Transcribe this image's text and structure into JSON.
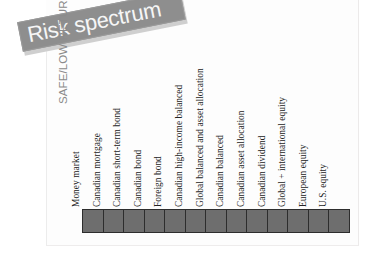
{
  "figure": {
    "title": "Risk spectrum",
    "axis_caption": "SAFE/LOW RETURN",
    "banner_color": "#8e8e8e",
    "banner_text_color": "#f6f6f6",
    "cell_color": "#6e6e6e",
    "cell_border_color": "#2d2d2d",
    "caption_color": "#8b8b8b"
  },
  "chart_data": {
    "type": "bar",
    "title": "Risk spectrum",
    "xlabel": "SAFE/LOW RETURN",
    "ylabel": "",
    "grid": false,
    "legend": "none",
    "orientation": "horizontal-sequence",
    "note": "Ordered risk spectrum: 13 equal-width cells, one per asset category, ordered from lowest risk/return on the left to highest on the right. All cells are identical uniform filled blocks.",
    "categories": [
      "Money market",
      "Canadian mortgage",
      "Canadian short-term bond",
      "Canadian bond",
      "Foreign bond",
      "Canadian high-income balanced",
      "Global balanced and asset allocation",
      "Canadian balanced",
      "Canadian asset allocation",
      "Canadian dividend",
      "Global + international equity",
      "European equity",
      "U.S. equity"
    ],
    "values": [
      1,
      1,
      1,
      1,
      1,
      1,
      1,
      1,
      1,
      1,
      1,
      1,
      1
    ],
    "rank": [
      1,
      2,
      3,
      4,
      5,
      6,
      7,
      8,
      9,
      10,
      11,
      12,
      13
    ],
    "ylim": [
      0,
      1
    ]
  },
  "spectrum": {
    "items": [
      {
        "label": "Money market"
      },
      {
        "label": "Canadian mortgage"
      },
      {
        "label": "Canadian short-term bond"
      },
      {
        "label": "Canadian bond"
      },
      {
        "label": "Foreign bond"
      },
      {
        "label": "Canadian high-income balanced"
      },
      {
        "label": "Global balanced and asset allocation"
      },
      {
        "label": "Canadian balanced"
      },
      {
        "label": "Canadian asset allocation"
      },
      {
        "label": "Canadian dividend"
      },
      {
        "label": "Global + international equity"
      },
      {
        "label": "European equity"
      },
      {
        "label": "U.S. equity"
      }
    ]
  }
}
